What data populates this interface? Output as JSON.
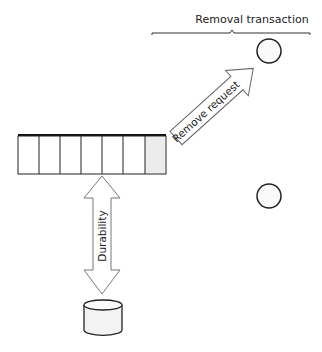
{
  "diagram": {
    "bracket_label": "Removal transaction",
    "arrow_remove_label": "Remove request",
    "arrow_durability_label": "Durability",
    "queue": {
      "slots": 7,
      "highlighted_slot": 7
    },
    "nodes": [
      "queue",
      "server-top",
      "server-bottom",
      "database"
    ]
  }
}
